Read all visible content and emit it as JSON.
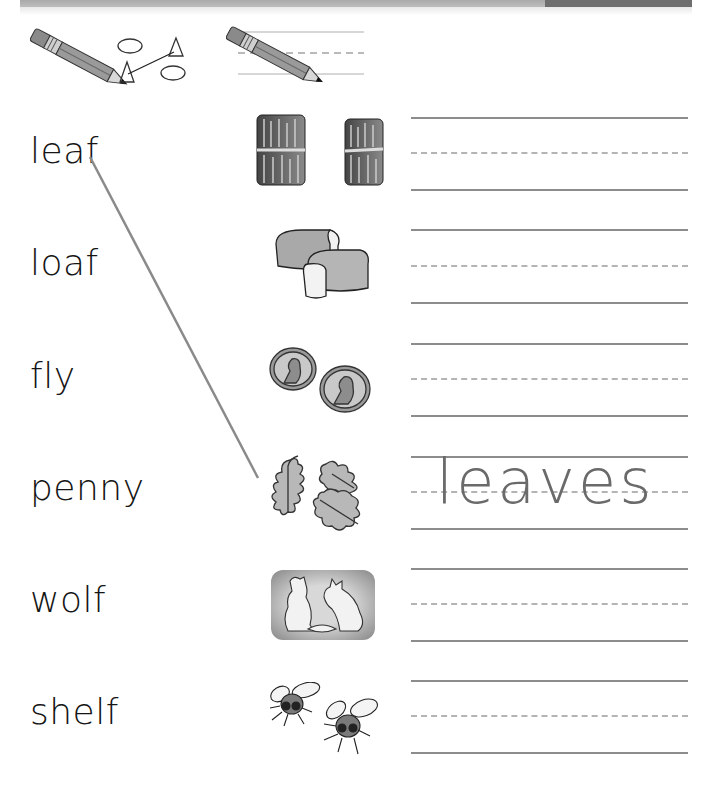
{
  "header": {
    "bar_color": "#b0b0b0",
    "accent_color": "#6e6e6e"
  },
  "directions": {
    "icons": [
      {
        "name": "pencil-match-icon",
        "meaning": "draw a line to match"
      },
      {
        "name": "pencil-write-icon",
        "meaning": "write on the lines"
      }
    ]
  },
  "words": [
    {
      "text": "leaf"
    },
    {
      "text": "loaf"
    },
    {
      "text": "fly"
    },
    {
      "text": "penny"
    },
    {
      "text": "wolf"
    },
    {
      "text": "shelf"
    }
  ],
  "pictures": [
    {
      "name": "shelves-picture",
      "depicts": "shelves"
    },
    {
      "name": "loaves-picture",
      "depicts": "loaves"
    },
    {
      "name": "pennies-picture",
      "depicts": "pennies"
    },
    {
      "name": "leaves-picture",
      "depicts": "leaves"
    },
    {
      "name": "wolves-picture",
      "depicts": "wolves"
    },
    {
      "name": "flies-picture",
      "depicts": "flies"
    }
  ],
  "writing_rows": [
    {
      "answer": ""
    },
    {
      "answer": ""
    },
    {
      "answer": ""
    },
    {
      "answer": "leaves"
    },
    {
      "answer": ""
    },
    {
      "answer": ""
    }
  ],
  "example": {
    "from_word": "leaf",
    "to_picture": "leaves",
    "written": "leaves",
    "line_color": "#8a8a8a"
  }
}
